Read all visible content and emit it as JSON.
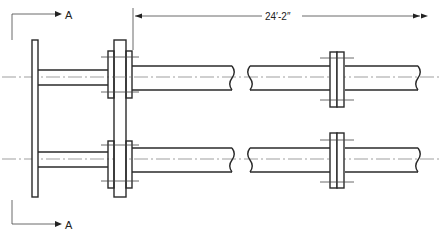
{
  "drawing": {
    "title": "Piping arrangement elevation with flanged connections",
    "section_marker_top": "A",
    "section_marker_bottom": "A",
    "dimension_label": "24′-2″",
    "line_color": "#2a2a2a",
    "background": "#ffffff"
  },
  "components": {
    "end_plate": "left-end-plate",
    "support_plate": "central-flange-support-plate",
    "pipes": [
      "upper-pipe",
      "lower-pipe"
    ],
    "right_flanges": [
      "upper-right-flange",
      "lower-right-flange"
    ]
  }
}
